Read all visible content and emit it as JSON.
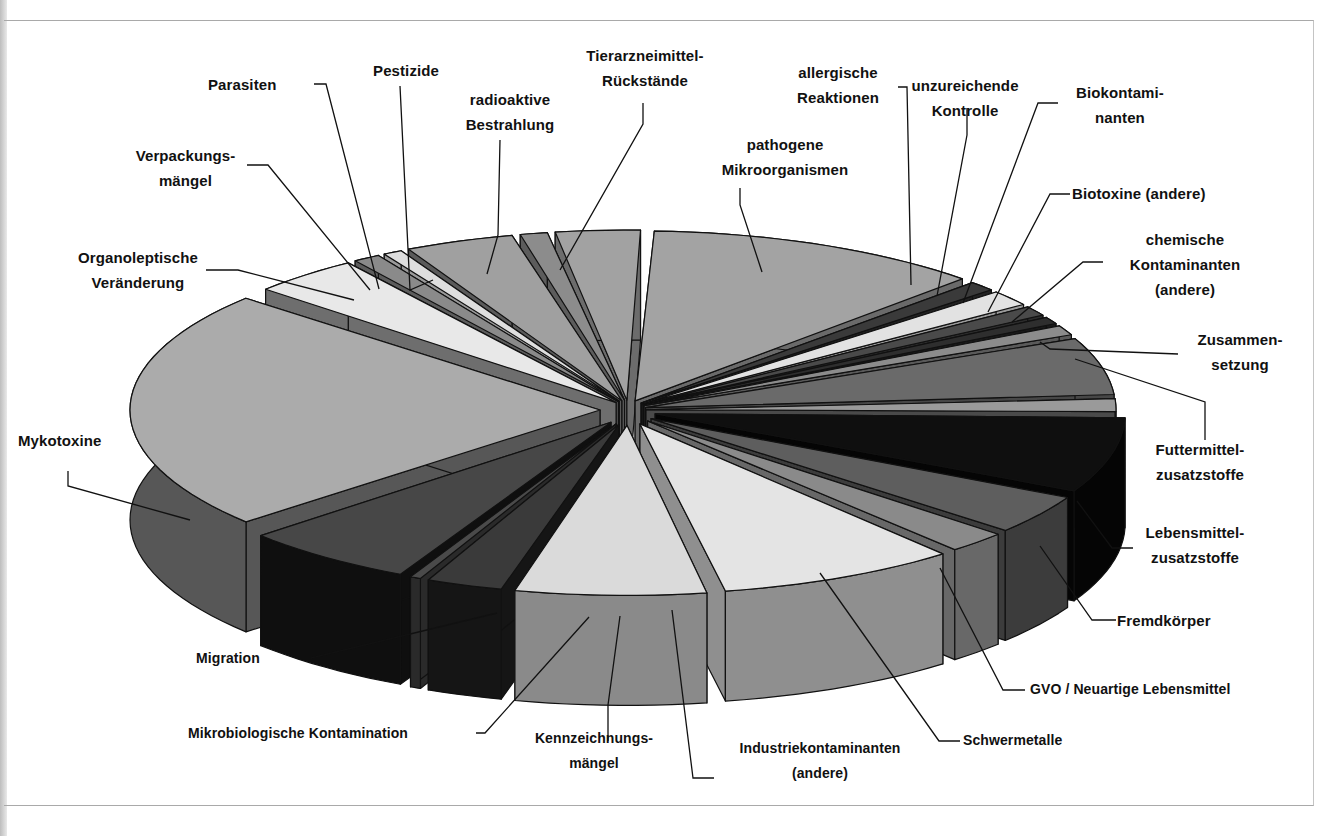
{
  "chart_data": {
    "type": "pie",
    "variant": "3d-exploded",
    "title": "",
    "legend": "none (leader-line labels)",
    "unit_note": "no values printed; values are estimated angular shares in degrees (sum 360)",
    "categories": [
      "pathogene Mikroorganismen",
      "allergische Reaktionen",
      "unzureichende Kontrolle",
      "Biokontaminanten",
      "Biotoxine (andere)",
      "chemische Kontaminanten (andere)",
      "Zusammensetzung",
      "Futtermittelzusatzstoffe",
      "Lebensmittelzusatzstoffe",
      "Fremdkörper",
      "GVO / Neuartige Lebensmittel",
      "Schwermetalle",
      "Industriekontaminanten (andere)",
      "Kennzeichnungsmängel",
      "Mikrobiologische Kontamination",
      "Migration",
      "Mykotoxine",
      "Organoleptische Veränderung",
      "Verpackungsmängel",
      "Parasiten",
      "Pestizide",
      "radioaktive Bestrahlung",
      "Tierarzneimittel-Rückstände"
    ],
    "values": [
      42,
      4,
      6,
      4,
      3,
      4,
      20,
      5,
      26,
      14,
      8,
      30,
      24,
      10,
      2,
      22,
      82,
      14,
      4,
      3,
      14,
      4,
      11
    ]
  },
  "labels": [
    {
      "id": "pathogene",
      "text": "pathogene\nMikroorganismen",
      "x": 700,
      "y": 132,
      "w": 170
    },
    {
      "id": "allergische",
      "text": "allergische\nReaktionen",
      "x": 768,
      "y": 60,
      "w": 140
    },
    {
      "id": "unzureichende",
      "text": "unzureichende\nKontrolle",
      "x": 900,
      "y": 73,
      "w": 130
    },
    {
      "id": "biokontaminanten",
      "text": "Biokontami-\nnanten",
      "x": 1060,
      "y": 80,
      "w": 120
    },
    {
      "id": "biotoxine",
      "text": "Biotoxine (andere)",
      "x": 1072,
      "y": 181,
      "w": 170,
      "align": "left"
    },
    {
      "id": "chemische",
      "text": "chemische\nKontaminanten\n(andere)",
      "x": 1110,
      "y": 227,
      "w": 150
    },
    {
      "id": "zusammensetzung",
      "text": "Zusammen-\nsetzung",
      "x": 1180,
      "y": 327,
      "w": 120
    },
    {
      "id": "futtermittel",
      "text": "Futtermittel-\nzusatzstoffe",
      "x": 1140,
      "y": 437,
      "w": 120
    },
    {
      "id": "lebensmittel",
      "text": "Lebensmittel-\nzusatzstoffe",
      "x": 1130,
      "y": 520,
      "w": 130
    },
    {
      "id": "fremdkoerper",
      "text": "Fremdkörper",
      "x": 1117,
      "y": 608,
      "w": 120,
      "align": "left"
    },
    {
      "id": "gvo",
      "text": "GVO / Neuartige Lebensmittel",
      "x": 1030,
      "y": 677,
      "w": 290,
      "align": "left",
      "condensed": true
    },
    {
      "id": "schwermetalle",
      "text": "Schwermetalle",
      "x": 963,
      "y": 728,
      "w": 150,
      "align": "left",
      "condensed": true
    },
    {
      "id": "industrie",
      "text": "Industriekontaminanten\n(andere)",
      "x": 710,
      "y": 736,
      "w": 220,
      "condensed": true
    },
    {
      "id": "kennzeichnung",
      "text": "Kennzeichnungs-\nmängel",
      "x": 519,
      "y": 726,
      "w": 150,
      "condensed": true
    },
    {
      "id": "mikrobiologische",
      "text": "Mikrobiologische Kontamination",
      "x": 188,
      "y": 721,
      "w": 290,
      "align": "left",
      "condensed": true
    },
    {
      "id": "migration",
      "text": "Migration",
      "x": 196,
      "y": 646,
      "w": 100,
      "align": "left",
      "condensed": true
    },
    {
      "id": "mykotoxine",
      "text": "Mykotoxine",
      "x": 18,
      "y": 428,
      "w": 110,
      "align": "left"
    },
    {
      "id": "organoleptische",
      "text": "Organoleptische\nVeränderung",
      "x": 58,
      "y": 245,
      "w": 160
    },
    {
      "id": "verpackung",
      "text": "Verpackungs-\nmängel",
      "x": 118,
      "y": 143,
      "w": 135
    },
    {
      "id": "parasiten",
      "text": "Parasiten",
      "x": 208,
      "y": 72,
      "w": 100,
      "align": "left"
    },
    {
      "id": "pestizide",
      "text": "Pestizide",
      "x": 356,
      "y": 58,
      "w": 100
    },
    {
      "id": "radioaktive",
      "text": "radioaktive\nBestrahlung",
      "x": 450,
      "y": 87,
      "w": 120
    },
    {
      "id": "tierarznei",
      "text": "Tierarzneimittel-\nRückstände",
      "x": 560,
      "y": 43,
      "w": 170
    }
  ],
  "leaders": [
    "M740,188 L740,205 L762,272",
    "M898,87 L907,87 L911,285",
    "M967,108 L967,135 L937,296",
    "M1058,103 L1038,103 L963,303",
    "M1070,194 L1050,194 L988,312",
    "M1103,262 L1083,262 L1012,322",
    "M1178,354 L1050,349 L1040,342",
    "M1205,440 L1205,402 L1075,359",
    "M1133,548 L1112,548 L1077,501",
    "M1116,620 L1092,620 L1040,546",
    "M1025,690 L1003,690 L940,568",
    "M960,741 L939,741 L820,573",
    "M714,778 L693,778 L672,610",
    "M608,741 L608,705 L620,616",
    "M476,733 L485,733 L589,617",
    "M296,658 L311,658 L497,613",
    "M68,471 L68,486 L190,520",
    "M206,270 L238,270 L354,300",
    "M247,165 L268,165 L370,290",
    "M314,84 L326,84 L379,289",
    "M400,86 L410,290 L433,280",
    "M500,140 L498,235 L487,274",
    "M643,103 L643,124 L560,270"
  ],
  "palette": {
    "light": "#d9d9d9",
    "mid_light": "#a6a6a6",
    "mid": "#7d7d7d",
    "mid_dark": "#5a5a5a",
    "dark": "#3e3e3e",
    "black": "#0d0d0d",
    "outline": "#111111"
  }
}
